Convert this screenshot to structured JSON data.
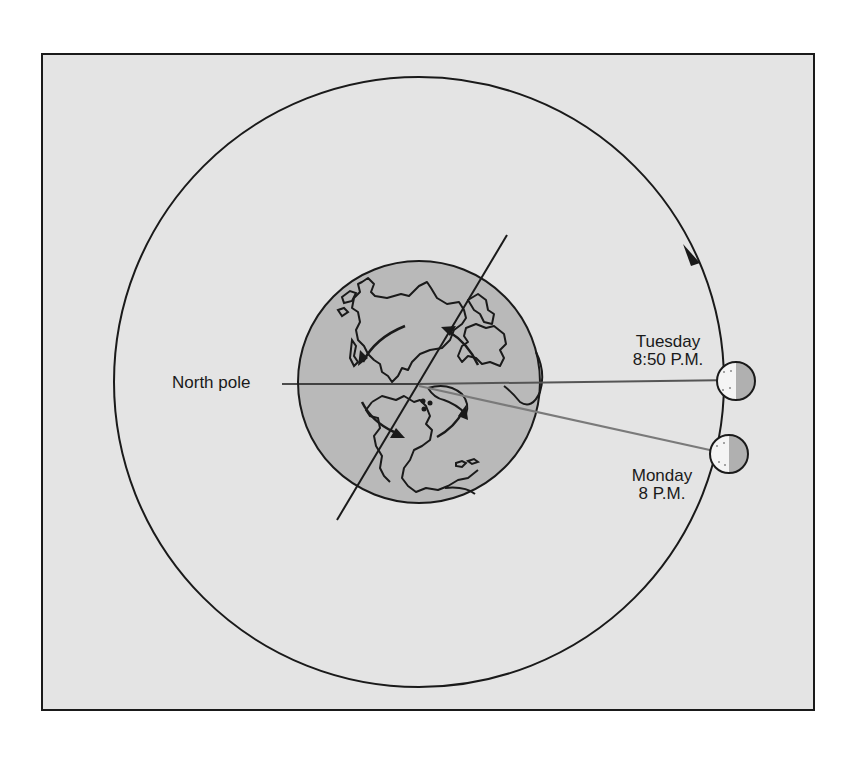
{
  "diagram": {
    "title": "",
    "colors": {
      "frame_background": "#e4e4e4",
      "frame_border": "#1a1a1a",
      "earth_fill": "#b9b9b9",
      "line": "#1a1a1a",
      "moon_light_half": "#f4f4f4",
      "moon_dark_half": "#b0b0b0",
      "sightline_to_monday": "#777777"
    },
    "labels": {
      "north_pole": "North pole",
      "tuesday_day": "Tuesday",
      "tuesday_time": "8:50 P.M.",
      "monday_day": "Monday",
      "monday_time": "8 P.M."
    },
    "elements": {
      "orbit": "Moon's orbit around Earth (counter-clockwise arrow)",
      "earth": "Earth viewed from above the North pole, with rotation arrows",
      "axis": "Earth's tilted axis line",
      "moon_monday": "Moon position Monday 8 P.M.",
      "moon_tuesday": "Moon position Tuesday 8:50 P.M."
    }
  }
}
